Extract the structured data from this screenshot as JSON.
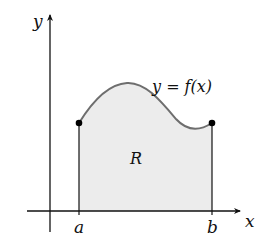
{
  "figure": {
    "axes": {
      "x_label": "x",
      "y_label": "y"
    },
    "curve_label": "y = f(x)",
    "region_label": "R",
    "bounds": {
      "left_label": "a",
      "right_label": "b"
    },
    "colors": {
      "axis": "#111111",
      "curve": "#6e6e6e",
      "region_fill": "#ececec",
      "endpoint": "#000000"
    }
  }
}
